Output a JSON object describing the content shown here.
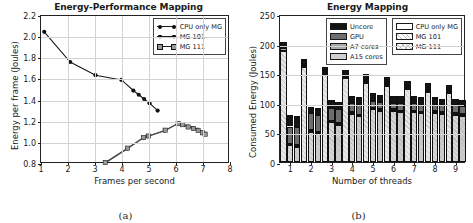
{
  "figure": {
    "panel_a_caption": "(a)",
    "panel_b_caption": "(b)"
  },
  "chart_data": [
    {
      "id": "panel-a",
      "type": "line",
      "title": "Energy-Performance Mapping",
      "xlabel": "Frames per second",
      "ylabel": "Energy per frame (Joules)",
      "xlim": [
        1,
        8
      ],
      "ylim": [
        0.8,
        2.2
      ],
      "xticks": [
        1,
        2,
        3,
        4,
        5,
        6,
        7,
        8
      ],
      "yticks": [
        0.8,
        1.0,
        1.2,
        1.4,
        1.6,
        1.8,
        2.0,
        2.2
      ],
      "grid": true,
      "legend_position": "top-right",
      "series": [
        {
          "name": "CPU only MG",
          "marker": "circle",
          "x": [
            1.12,
            2.08,
            3.02,
            3.98,
            4.42,
            4.62,
            4.82,
            5.02,
            5.32
          ],
          "y": [
            2.05,
            1.765,
            1.64,
            1.595,
            1.495,
            1.455,
            1.415,
            1.375,
            1.305
          ]
        },
        {
          "name": "MG 101",
          "marker": "triangle",
          "x": [
            3.38,
            4.2,
            4.78,
            4.95,
            5.58,
            6.05,
            6.2,
            6.4,
            6.62,
            6.78,
            6.95,
            7.05
          ],
          "y": [
            0.81,
            0.945,
            1.045,
            1.06,
            1.115,
            1.18,
            1.175,
            1.155,
            1.14,
            1.125,
            1.1,
            1.085
          ]
        },
        {
          "name": "MG 111",
          "marker": "square",
          "x": [
            3.38,
            4.2,
            4.8,
            4.98,
            5.6,
            6.08,
            6.25,
            6.45,
            6.65,
            6.82,
            6.98,
            7.08
          ],
          "y": [
            0.815,
            0.95,
            1.05,
            1.065,
            1.12,
            1.182,
            1.172,
            1.15,
            1.135,
            1.118,
            1.095,
            1.082
          ]
        }
      ]
    },
    {
      "id": "panel-b",
      "type": "bar",
      "title": "Energy Mapping",
      "xlabel": "Number of threads",
      "ylabel": "Consumed Energy (Joules)",
      "ylim": [
        0,
        250
      ],
      "yticks": [
        0,
        50,
        100,
        150,
        200,
        250
      ],
      "categories": [
        "1",
        "2",
        "3",
        "4",
        "5",
        "6",
        "7",
        "8",
        "9"
      ],
      "grid": true,
      "stacked": true,
      "components": [
        "A15 cores",
        "A7 cores",
        "GPU",
        "Uncore"
      ],
      "component_colors": [
        "#cfcfcf",
        "#a8a8a8",
        "#6e6e6e",
        "#141414"
      ],
      "variants": [
        "CPU only MG",
        "MG 101",
        "MG 111"
      ],
      "legend_position": "top-right",
      "groups": [
        {
          "category": "1",
          "bars": [
            {
              "variant": "CPU only MG",
              "A15 cores": 188,
              "A7 cores": 4,
              "GPU": 3,
              "Uncore": 8,
              "total": 203
            },
            {
              "variant": "MG 101",
              "A15 cores": 28,
              "A7 cores": 3,
              "GPU": 29,
              "Uncore": 19,
              "total": 79
            },
            {
              "variant": "MG 111",
              "A15 cores": 25,
              "A7 cores": 4,
              "GPU": 30,
              "Uncore": 19,
              "total": 78
            }
          ]
        },
        {
          "category": "2",
          "bars": [
            {
              "variant": "CPU only MG",
              "A15 cores": 160,
              "A7 cores": 3,
              "GPU": 3,
              "Uncore": 8,
              "total": 174
            },
            {
              "variant": "MG 101",
              "A15 cores": 51,
              "A7 cores": 3,
              "GPU": 28,
              "Uncore": 11,
              "total": 93
            },
            {
              "variant": "MG 111",
              "A15 cores": 48,
              "A7 cores": 3,
              "GPU": 29,
              "Uncore": 11,
              "total": 91
            }
          ]
        },
        {
          "category": "3",
          "bars": [
            {
              "variant": "CPU only MG",
              "A15 cores": 147,
              "A7 cores": 3,
              "GPU": 3,
              "Uncore": 8,
              "total": 161
            },
            {
              "variant": "MG 101",
              "A15 cores": 67,
              "A7 cores": 3,
              "GPU": 22,
              "Uncore": 12,
              "total": 104
            },
            {
              "variant": "MG 111",
              "A15 cores": 63,
              "A7 cores": 3,
              "GPU": 24,
              "Uncore": 12,
              "total": 102
            }
          ]
        },
        {
          "category": "4",
          "bars": [
            {
              "variant": "CPU only MG",
              "A15 cores": 142,
              "A7 cores": 3,
              "GPU": 3,
              "Uncore": 8,
              "total": 156
            },
            {
              "variant": "MG 101",
              "A15 cores": 81,
              "A7 cores": 3,
              "GPU": 15,
              "Uncore": 12,
              "total": 111
            },
            {
              "variant": "MG 111",
              "A15 cores": 77,
              "A7 cores": 3,
              "GPU": 17,
              "Uncore": 12,
              "total": 109
            }
          ]
        },
        {
          "category": "5",
          "bars": [
            {
              "variant": "CPU only MG",
              "A15 cores": 134,
              "A7 cores": 3,
              "GPU": 3,
              "Uncore": 8,
              "total": 148
            },
            {
              "variant": "MG 101",
              "A15 cores": 89,
              "A7 cores": 3,
              "GPU": 11,
              "Uncore": 13,
              "total": 116
            },
            {
              "variant": "MG 111",
              "A15 cores": 86,
              "A7 cores": 3,
              "GPU": 12,
              "Uncore": 13,
              "total": 114
            }
          ]
        },
        {
          "category": "6",
          "bars": [
            {
              "variant": "CPU only MG",
              "A15 cores": 129,
              "A7 cores": 3,
              "GPU": 3,
              "Uncore": 8,
              "total": 143
            },
            {
              "variant": "MG 101",
              "A15 cores": 86,
              "A7 cores": 3,
              "GPU": 11,
              "Uncore": 12,
              "total": 112
            },
            {
              "variant": "MG 111",
              "A15 cores": 84,
              "A7 cores": 3,
              "GPU": 12,
              "Uncore": 12,
              "total": 111
            }
          ]
        },
        {
          "category": "7",
          "bars": [
            {
              "variant": "CPU only MG",
              "A15 cores": 123,
              "A7 cores": 3,
              "GPU": 3,
              "Uncore": 8,
              "total": 137
            },
            {
              "variant": "MG 101",
              "A15 cores": 84,
              "A7 cores": 3,
              "GPU": 12,
              "Uncore": 12,
              "total": 111
            },
            {
              "variant": "MG 111",
              "A15 cores": 82,
              "A7 cores": 3,
              "GPU": 12,
              "Uncore": 12,
              "total": 109
            }
          ]
        },
        {
          "category": "8",
          "bars": [
            {
              "variant": "CPU only MG",
              "A15 cores": 119,
              "A7 cores": 3,
              "GPU": 3,
              "Uncore": 8,
              "total": 133
            },
            {
              "variant": "MG 101",
              "A15 cores": 83,
              "A7 cores": 3,
              "GPU": 12,
              "Uncore": 11,
              "total": 109
            },
            {
              "variant": "MG 111",
              "A15 cores": 81,
              "A7 cores": 3,
              "GPU": 12,
              "Uncore": 11,
              "total": 107
            }
          ]
        },
        {
          "category": "9",
          "bars": [
            {
              "variant": "CPU only MG",
              "A15 cores": 116,
              "A7 cores": 3,
              "GPU": 3,
              "Uncore": 8,
              "total": 130
            },
            {
              "variant": "MG 101",
              "A15 cores": 80,
              "A7 cores": 3,
              "GPU": 13,
              "Uncore": 11,
              "total": 107
            },
            {
              "variant": "MG 111",
              "A15 cores": 78,
              "A7 cores": 3,
              "GPU": 13,
              "Uncore": 11,
              "total": 105
            }
          ]
        }
      ]
    }
  ]
}
